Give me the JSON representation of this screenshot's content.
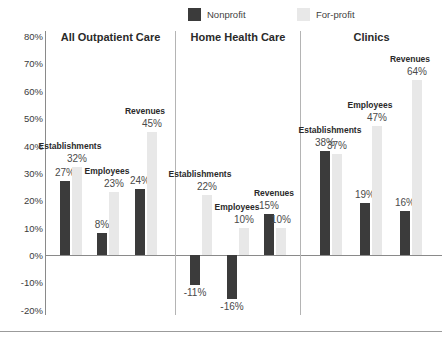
{
  "legend": {
    "entries": [
      {
        "label": "Nonprofit",
        "color": "#3b3b3b",
        "key": "nonprofit"
      },
      {
        "label": "For-profit",
        "color": "#e8e8e8",
        "key": "forprofit"
      }
    ]
  },
  "axis": {
    "ticks": [
      "80%",
      "70%",
      "60%",
      "50%",
      "40%",
      "30%",
      "20%",
      "10%",
      "0%",
      "-10%",
      "-20%"
    ],
    "min": -20,
    "max": 80,
    "step": 10
  },
  "panels": [
    {
      "title": "All Outpatient Care",
      "groups": [
        {
          "label": "Establishments",
          "nonprofit": {
            "value": 27,
            "label": "27%"
          },
          "forprofit": {
            "value": 32,
            "label": "32%"
          }
        },
        {
          "label": "Employees",
          "nonprofit": {
            "value": 8,
            "label": "8%"
          },
          "forprofit": {
            "value": 23,
            "label": "23%"
          }
        },
        {
          "label": "Revenues",
          "nonprofit": {
            "value": 24,
            "label": "24%"
          },
          "forprofit": {
            "value": 45,
            "label": "45%"
          }
        }
      ]
    },
    {
      "title": "Home Health Care",
      "groups": [
        {
          "label": "Establishments",
          "nonprofit": {
            "value": -11,
            "label": "-11%"
          },
          "forprofit": {
            "value": 22,
            "label": "22%"
          }
        },
        {
          "label": "Employees",
          "nonprofit": {
            "value": -16,
            "label": "-16%"
          },
          "forprofit": {
            "value": 10,
            "label": "10%"
          }
        },
        {
          "label": "Revenues",
          "nonprofit": {
            "value": 15,
            "label": "15%"
          },
          "forprofit": {
            "value": 10,
            "label": "10%"
          }
        }
      ]
    },
    {
      "title": "Clinics",
      "groups": [
        {
          "label": "Establishments",
          "nonprofit": {
            "value": 38,
            "label": "38%"
          },
          "forprofit": {
            "value": 37,
            "label": "37%"
          }
        },
        {
          "label": "Employees",
          "nonprofit": {
            "value": 19,
            "label": "19%"
          },
          "forprofit": {
            "value": 47,
            "label": "47%"
          }
        },
        {
          "label": "Revenues",
          "nonprofit": {
            "value": 16,
            "label": "16%"
          },
          "forprofit": {
            "value": 64,
            "label": "64%"
          }
        }
      ]
    }
  ],
  "chart_data": {
    "type": "bar",
    "title": "",
    "subtitle": "",
    "xlabel": "",
    "ylabel": "",
    "ylim": [
      -20,
      80
    ],
    "ytick_labels": [
      "-20%",
      "-10%",
      "0%",
      "10%",
      "20%",
      "30%",
      "40%",
      "50%",
      "60%",
      "70%",
      "80%"
    ],
    "grid": false,
    "legend_position": "top-center",
    "panels": [
      "All Outpatient Care",
      "Home Health Care",
      "Clinics"
    ],
    "categories": [
      "Establishments",
      "Employees",
      "Revenues"
    ],
    "series": [
      {
        "name": "Nonprofit",
        "color": "#3b3b3b",
        "values_by_panel": {
          "All Outpatient Care": [
            27,
            8,
            24
          ],
          "Home Health Care": [
            -11,
            -16,
            15
          ],
          "Clinics": [
            38,
            19,
            16
          ]
        }
      },
      {
        "name": "For-profit",
        "color": "#e8e8e8",
        "values_by_panel": {
          "All Outpatient Care": [
            32,
            23,
            45
          ],
          "Home Health Care": [
            22,
            10,
            10
          ],
          "Clinics": [
            37,
            47,
            64
          ]
        }
      }
    ],
    "data_labels": [
      "27%",
      "32%",
      "8%",
      "23%",
      "24%",
      "45%",
      "-11%",
      "22%",
      "-16%",
      "10%",
      "15%",
      "10%",
      "38%",
      "37%",
      "19%",
      "47%",
      "16%",
      "64%"
    ]
  }
}
